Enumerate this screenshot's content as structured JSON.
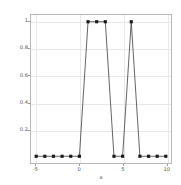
{
  "chart_data": {
    "type": "line",
    "title": "",
    "xlabel": "x",
    "ylabel": "",
    "xlim": [
      -5.6,
      10.6
    ],
    "ylim": [
      -0.05,
      1.05
    ],
    "grid": true,
    "legend": null,
    "marker": "square",
    "line_color": "#3a3a3a",
    "marker_color": "#1a1a1a",
    "x": [
      -5,
      -4,
      -3,
      -2,
      -1,
      0,
      1,
      2,
      3,
      4,
      5,
      6,
      7,
      8,
      9,
      10
    ],
    "values": [
      0,
      0,
      0,
      0,
      0,
      0,
      1,
      1,
      1,
      0,
      0,
      1,
      0,
      0,
      0,
      0
    ],
    "xticks": [
      -5,
      0,
      5,
      10
    ],
    "xtick_labels": [
      "-5",
      "0",
      "5",
      "10"
    ],
    "yticks": [
      0.2,
      0.4,
      0.6,
      0.8,
      1
    ],
    "ytick_labels": [
      "0.2",
      "0.4",
      "0.6",
      "0.8",
      "1"
    ]
  }
}
